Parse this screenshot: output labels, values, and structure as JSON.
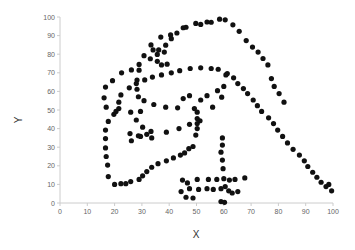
{
  "chart_data": {
    "type": "scatter",
    "title": "",
    "xlabel": "X",
    "ylabel": "Y",
    "xlim": [
      0,
      100
    ],
    "ylim": [
      0,
      100
    ],
    "xticks": [
      0,
      10,
      20,
      30,
      40,
      50,
      60,
      70,
      80,
      90,
      100
    ],
    "yticks": [
      0,
      10,
      20,
      30,
      40,
      50,
      60,
      70,
      80,
      90,
      100
    ],
    "grid": false,
    "marker_color": "#111111",
    "series": [
      {
        "name": "dino",
        "points": [
          [
            55.38,
            97.18
          ],
          [
            51.54,
            96.03
          ],
          [
            46.15,
            94.49
          ],
          [
            42.82,
            91.41
          ],
          [
            40.77,
            88.33
          ],
          [
            38.72,
            84.87
          ],
          [
            35.64,
            79.87
          ],
          [
            33.08,
            77.56
          ],
          [
            28.97,
            74.48
          ],
          [
            28.97,
            71.4
          ],
          [
            28.21,
            66.1
          ],
          [
            28.21,
            61.15
          ],
          [
            28.72,
            57.13
          ],
          [
            30.77,
            55.04
          ],
          [
            34.36,
            52.95
          ],
          [
            38.72,
            51.54
          ],
          [
            43.08,
            51.15
          ],
          [
            49.23,
            50.77
          ],
          [
            50.26,
            48.85
          ],
          [
            50.26,
            45.38
          ],
          [
            50.26,
            42.69
          ],
          [
            50.26,
            40.0
          ],
          [
            49.74,
            36.54
          ],
          [
            48.72,
            30.38
          ],
          [
            47.18,
            29.23
          ],
          [
            45.64,
            26.92
          ],
          [
            44.1,
            25.77
          ],
          [
            41.54,
            24.23
          ],
          [
            38.97,
            22.69
          ],
          [
            35.9,
            21.15
          ],
          [
            33.59,
            19.23
          ],
          [
            31.79,
            16.92
          ],
          [
            30.26,
            14.62
          ],
          [
            28.97,
            12.69
          ],
          [
            25.9,
            11.54
          ],
          [
            24.1,
            10.38
          ],
          [
            22.31,
            10.38
          ],
          [
            20.0,
            10.0
          ],
          [
            17.69,
            14.23
          ],
          [
            17.44,
            20.38
          ],
          [
            16.92,
            25.0
          ],
          [
            16.67,
            29.62
          ],
          [
            16.67,
            34.62
          ],
          [
            16.67,
            39.23
          ],
          [
            17.69,
            43.85
          ],
          [
            19.74,
            47.69
          ],
          [
            21.54,
            50.77
          ],
          [
            21.54,
            54.23
          ],
          [
            22.31,
            58.08
          ],
          [
            25.38,
            61.92
          ],
          [
            27.95,
            64.23
          ],
          [
            31.03,
            66.15
          ],
          [
            33.85,
            67.69
          ],
          [
            37.18,
            68.85
          ],
          [
            40.77,
            70.0
          ],
          [
            43.85,
            71.15
          ],
          [
            47.69,
            72.31
          ],
          [
            51.54,
            72.69
          ],
          [
            55.38,
            72.31
          ],
          [
            57.95,
            71.92
          ],
          [
            61.28,
            69.62
          ],
          [
            63.59,
            67.31
          ],
          [
            65.13,
            64.23
          ],
          [
            67.18,
            61.54
          ],
          [
            68.72,
            58.85
          ],
          [
            70.77,
            55.38
          ],
          [
            72.31,
            52.31
          ],
          [
            73.85,
            49.23
          ],
          [
            76.41,
            45.77
          ],
          [
            78.21,
            42.69
          ],
          [
            79.74,
            39.23
          ],
          [
            81.54,
            35.77
          ],
          [
            83.33,
            32.31
          ],
          [
            85.38,
            28.85
          ],
          [
            87.69,
            25.77
          ],
          [
            89.49,
            22.69
          ],
          [
            90.77,
            19.62
          ],
          [
            92.56,
            16.54
          ],
          [
            94.1,
            13.85
          ],
          [
            95.64,
            11.15
          ],
          [
            97.44,
            8.85
          ],
          [
            98.46,
            10.0
          ],
          [
            99.49,
            6.54
          ],
          [
            29.49,
            49.23
          ],
          [
            25.9,
            48.85
          ],
          [
            20.51,
            49.23
          ],
          [
            16.92,
            51.54
          ],
          [
            16.15,
            56.54
          ],
          [
            16.67,
            62.31
          ],
          [
            19.23,
            65.77
          ],
          [
            22.56,
            70.0
          ],
          [
            26.15,
            71.54
          ],
          [
            30.77,
            79.23
          ],
          [
            33.33,
            85.0
          ],
          [
            36.92,
            89.23
          ],
          [
            40.51,
            90.38
          ],
          [
            45.13,
            94.23
          ],
          [
            49.74,
            96.54
          ],
          [
            53.85,
            97.31
          ],
          [
            58.46,
            98.85
          ],
          [
            60.51,
            98.46
          ],
          [
            63.33,
            95.77
          ],
          [
            65.64,
            92.31
          ],
          [
            68.21,
            87.31
          ],
          [
            70.51,
            83.85
          ],
          [
            72.56,
            81.15
          ],
          [
            74.36,
            77.69
          ],
          [
            76.15,
            74.23
          ],
          [
            77.44,
            66.92
          ],
          [
            78.46,
            62.69
          ],
          [
            80.26,
            58.85
          ],
          [
            82.05,
            54.23
          ],
          [
            34.1,
            82.31
          ],
          [
            36.15,
            82.31
          ],
          [
            38.21,
            81.15
          ],
          [
            35.64,
            76.15
          ],
          [
            37.18,
            74.23
          ],
          [
            39.23,
            74.62
          ],
          [
            45.13,
            56.15
          ],
          [
            47.44,
            57.69
          ],
          [
            51.54,
            55.38
          ],
          [
            53.85,
            57.69
          ],
          [
            57.69,
            60.38
          ],
          [
            60.0,
            62.69
          ],
          [
            60.77,
            68.85
          ],
          [
            59.23,
            56.92
          ],
          [
            55.9,
            51.54
          ],
          [
            51.28,
            44.23
          ],
          [
            47.44,
            42.31
          ],
          [
            43.59,
            40.0
          ],
          [
            38.97,
            38.08
          ],
          [
            33.59,
            35.0
          ],
          [
            29.49,
            35.77
          ],
          [
            26.15,
            33.46
          ],
          [
            25.64,
            37.31
          ],
          [
            28.72,
            36.15
          ],
          [
            31.79,
            36.92
          ],
          [
            33.33,
            38.46
          ],
          [
            30.26,
            40.77
          ],
          [
            27.95,
            44.62
          ],
          [
            59.49,
            35.0
          ],
          [
            59.49,
            31.15
          ],
          [
            58.97,
            27.31
          ],
          [
            59.49,
            23.08
          ],
          [
            59.74,
            18.46
          ],
          [
            60.0,
            13.08
          ],
          [
            60.51,
            8.85
          ],
          [
            58.97,
            7.69
          ],
          [
            56.15,
            7.31
          ],
          [
            53.85,
            7.69
          ],
          [
            50.77,
            7.31
          ],
          [
            47.44,
            7.69
          ],
          [
            44.36,
            6.15
          ],
          [
            46.15,
            3.08
          ],
          [
            48.72,
            2.69
          ],
          [
            46.67,
            10.77
          ],
          [
            44.87,
            12.31
          ],
          [
            50.26,
            12.69
          ],
          [
            54.36,
            12.69
          ],
          [
            57.44,
            12.69
          ],
          [
            62.05,
            12.31
          ],
          [
            64.1,
            12.69
          ],
          [
            67.69,
            13.46
          ],
          [
            61.79,
            6.54
          ],
          [
            65.13,
            6.15
          ],
          [
            63.08,
            5.38
          ],
          [
            58.97,
            0.77
          ],
          [
            60.26,
            0.38
          ]
        ]
      }
    ]
  },
  "plot": {
    "x_label": "X",
    "y_label": "Y"
  }
}
